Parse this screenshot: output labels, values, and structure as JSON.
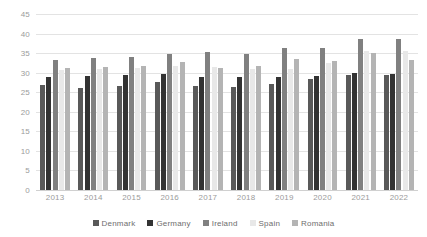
{
  "chart_data": {
    "type": "bar",
    "title": "",
    "subtitle": "",
    "xlabel": "",
    "ylabel": "",
    "ylim": [
      0,
      45
    ],
    "ytick_step": 5,
    "yticks": [
      45,
      40,
      35,
      30,
      25,
      20,
      15,
      10,
      5,
      0
    ],
    "grid": true,
    "legend_position": "bottom",
    "categories": [
      "2013",
      "2014",
      "2015",
      "2016",
      "2017",
      "2018",
      "2019",
      "2020",
      "2021",
      "2022"
    ],
    "series": [
      {
        "name": "Denmark",
        "color": "#595959",
        "values": [
          26.9,
          26.2,
          26.6,
          27.5,
          26.6,
          26.4,
          27.2,
          28.3,
          29.4,
          29.4
        ]
      },
      {
        "name": "Germany",
        "color": "#333333",
        "values": [
          29.0,
          29.1,
          29.5,
          29.7,
          29.0,
          29.0,
          28.9,
          29.2,
          29.8,
          29.7
        ]
      },
      {
        "name": "Ireland",
        "color": "#808080",
        "values": [
          33.3,
          33.8,
          34.0,
          34.8,
          35.4,
          34.7,
          36.3,
          36.3,
          38.6,
          38.7
        ]
      },
      {
        "name": "Spain",
        "color": "#e8e8e8",
        "values": [
          30.7,
          31.0,
          31.3,
          31.6,
          31.5,
          31.0,
          30.9,
          32.4,
          35.5,
          35.6
        ]
      },
      {
        "name": "Romania",
        "color": "#b4b4b4",
        "values": [
          31.2,
          31.5,
          31.6,
          32.7,
          31.2,
          31.7,
          33.6,
          33.1,
          35.1,
          33.2
        ]
      }
    ]
  },
  "axis": {
    "y_labels": [
      "45",
      "40",
      "35",
      "30",
      "25",
      "20",
      "15",
      "10",
      "5",
      "0"
    ],
    "x_labels": [
      "2013",
      "2014",
      "2015",
      "2016",
      "2017",
      "2018",
      "2019",
      "2020",
      "2021",
      "2022"
    ]
  },
  "legend": {
    "items": [
      {
        "label": "Denmark",
        "color": "#595959"
      },
      {
        "label": "Germany",
        "color": "#333333"
      },
      {
        "label": "Ireland",
        "color": "#808080"
      },
      {
        "label": "Spain",
        "color": "#e8e8e8"
      },
      {
        "label": "Romania",
        "color": "#b4b4b4"
      }
    ]
  },
  "colors": {
    "gridline": "#e3e3e3",
    "axis_text": "#9b9b9b",
    "legend_text": "#6e6e6e",
    "background": "#ffffff"
  }
}
